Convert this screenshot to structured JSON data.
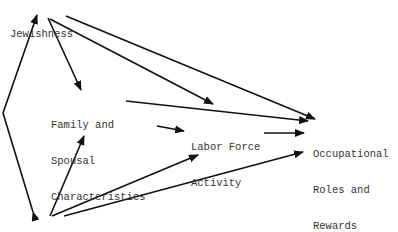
{
  "diagram": {
    "type": "path-diagram",
    "nodes": [
      {
        "id": "jewishness",
        "lines": [
          "Jewishness"
        ]
      },
      {
        "id": "family",
        "lines": [
          "Family and",
          "Spousal",
          "Characteristics"
        ]
      },
      {
        "id": "labor",
        "lines": [
          "Labor Force",
          "Activity"
        ]
      },
      {
        "id": "occupational",
        "lines": [
          "Occupational",
          "Roles and",
          "Rewards"
        ]
      },
      {
        "id": "education",
        "lines": [
          "Education"
        ]
      }
    ],
    "edges": [
      {
        "from": "education",
        "to": "jewishness",
        "style": "curved-bidirectional"
      },
      {
        "from": "jewishness",
        "to": "family"
      },
      {
        "from": "jewishness",
        "to": "labor"
      },
      {
        "from": "jewishness",
        "to": "occupational"
      },
      {
        "from": "education",
        "to": "family"
      },
      {
        "from": "education",
        "to": "labor"
      },
      {
        "from": "education",
        "to": "occupational"
      },
      {
        "from": "family",
        "to": "labor"
      },
      {
        "from": "family",
        "to": "occupational"
      },
      {
        "from": "labor",
        "to": "occupational"
      }
    ],
    "colors": {
      "line": "#111111",
      "text": "#333333",
      "background": "#ffffff"
    }
  }
}
